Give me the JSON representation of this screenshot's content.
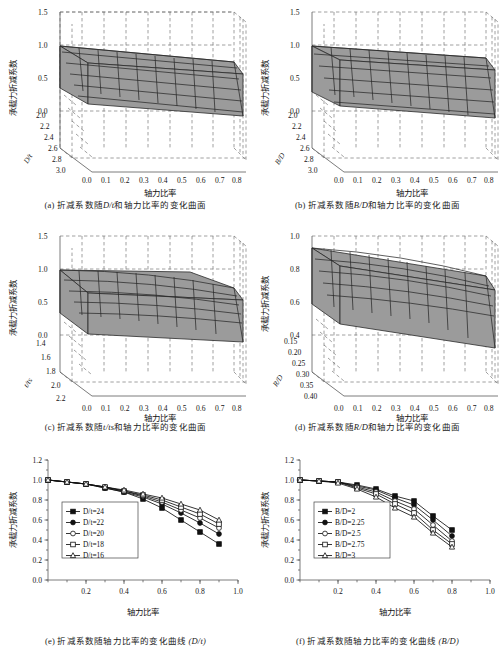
{
  "figure": {
    "surface_fill": "#9b9b9b",
    "mesh_color": "#2a2a2a",
    "axis_color": "#5a5a5a"
  },
  "panels": {
    "a": {
      "caption_prefix": "(a)",
      "caption_text_1": "折减系数随",
      "caption_sym": "D/t",
      "caption_text_2": "和轴力比率的变化曲面",
      "zlabel": "承载力折减系数",
      "xlabel": "轴力比率",
      "ylabel": "D/t",
      "zticks": [
        "1.5",
        "1.0",
        "0.5",
        "0.0"
      ],
      "yticks": [
        "2.0",
        "2.2",
        "2.4",
        "2.6",
        "2.8",
        "3.0"
      ],
      "xticks": [
        "0.0",
        "0.1",
        "0.2",
        "0.3",
        "0.4",
        "0.5",
        "0.6",
        "0.7",
        "0.8"
      ]
    },
    "b": {
      "caption_prefix": "(b)",
      "caption_text_1": "折减系数随",
      "caption_sym": "B/D",
      "caption_text_2": "和轴力比率的变化曲面",
      "zlabel": "承载力折减系数",
      "xlabel": "轴力比率",
      "ylabel": "B/D",
      "zticks": [
        "1.5",
        "1.0",
        "0.5",
        "0.0"
      ],
      "yticks": [
        "2.0",
        "2.2",
        "2.4",
        "2.6",
        "2.8",
        "3.0"
      ],
      "xticks": [
        "0.0",
        "0.1",
        "0.2",
        "0.3",
        "0.4",
        "0.5",
        "0.6",
        "0.7",
        "0.8"
      ]
    },
    "c": {
      "caption_prefix": "(c)",
      "caption_text_1": "折减系数随",
      "caption_sym": "t/ts",
      "caption_text_2": "和轴力比率的变化曲面",
      "zlabel": "承载力折减系数",
      "xlabel": "轴力比率",
      "ylabel": "t/ts",
      "zticks": [
        "1.5",
        "1.0",
        "0.5",
        "0.0"
      ],
      "yticks": [
        "1.4",
        "1.6",
        "1.8",
        "2.0",
        "2.2"
      ],
      "xticks": [
        "0.0",
        "0.1",
        "0.2",
        "0.3",
        "0.4",
        "0.5",
        "0.6",
        "0.7",
        "0.8"
      ]
    },
    "d": {
      "caption_prefix": "(d)",
      "caption_text_1": "折减系数随",
      "caption_sym": "R/D",
      "caption_text_2": "和轴力比率的变化曲面",
      "zlabel": "承载力折减系数",
      "xlabel": "轴力比率",
      "ylabel": "R/D",
      "zticks": [
        "1.0",
        "0.8",
        "0.6",
        "0.4"
      ],
      "yticks": [
        "0.15",
        "0.20",
        "0.25",
        "0.30",
        "0.35",
        "0.40"
      ],
      "xticks": [
        "0.0",
        "0.1",
        "0.2",
        "0.3",
        "0.4",
        "0.5",
        "0.6",
        "0.7",
        "0.8"
      ]
    },
    "e": {
      "caption_prefix": "(e)",
      "caption_text_1": "折减系数随轴力比率的变化曲线",
      "caption_sym": "(D/t)",
      "ylabel": "承载力折减系数",
      "xlabel": "轴力比率"
    },
    "f": {
      "caption_prefix": "(f)",
      "caption_text_1": "折减系数随轴力比率的变化曲线",
      "caption_sym": "(B/D)",
      "ylabel": "承载力折减系数",
      "xlabel": "轴力比率"
    }
  },
  "chart_data": [
    {
      "id": "a",
      "type": "surface",
      "title": "折减系数随D/t和轴力比率的变化曲面",
      "xlabel": "轴力比率",
      "ylabel": "D/t",
      "zlabel": "承载力折减系数",
      "xlim": [
        0.0,
        0.8
      ],
      "ylim": [
        2.0,
        3.0
      ],
      "zlim": [
        0.0,
        1.5
      ],
      "x": [
        0.0,
        0.1,
        0.2,
        0.3,
        0.4,
        0.5,
        0.6,
        0.7,
        0.8
      ],
      "y": [
        2.0,
        2.2,
        2.4,
        2.6,
        2.8,
        3.0
      ],
      "z": [
        [
          1.0,
          0.97,
          0.94,
          0.9,
          0.86,
          0.8,
          0.73,
          0.64,
          0.53
        ],
        [
          1.0,
          0.97,
          0.94,
          0.9,
          0.85,
          0.79,
          0.71,
          0.61,
          0.5
        ],
        [
          1.0,
          0.97,
          0.93,
          0.89,
          0.84,
          0.77,
          0.69,
          0.58,
          0.46
        ],
        [
          1.0,
          0.96,
          0.93,
          0.88,
          0.83,
          0.76,
          0.67,
          0.56,
          0.43
        ],
        [
          1.0,
          0.96,
          0.92,
          0.87,
          0.81,
          0.74,
          0.65,
          0.53,
          0.4
        ],
        [
          1.0,
          0.96,
          0.92,
          0.86,
          0.8,
          0.72,
          0.62,
          0.5,
          0.37
        ]
      ]
    },
    {
      "id": "b",
      "type": "surface",
      "title": "折减系数随B/D和轴力比率的变化曲面",
      "xlabel": "轴力比率",
      "ylabel": "B/D",
      "zlabel": "承载力折减系数",
      "xlim": [
        0.0,
        0.8
      ],
      "ylim": [
        2.0,
        3.0
      ],
      "zlim": [
        0.0,
        1.5
      ],
      "x": [
        0.0,
        0.1,
        0.2,
        0.3,
        0.4,
        0.5,
        0.6,
        0.7,
        0.8
      ],
      "y": [
        2.0,
        2.2,
        2.4,
        2.6,
        2.8,
        3.0
      ],
      "z": [
        [
          1.0,
          0.98,
          0.96,
          0.92,
          0.88,
          0.83,
          0.76,
          0.66,
          0.54
        ],
        [
          1.0,
          0.98,
          0.95,
          0.91,
          0.87,
          0.81,
          0.73,
          0.63,
          0.5
        ],
        [
          1.0,
          0.97,
          0.94,
          0.9,
          0.85,
          0.79,
          0.71,
          0.6,
          0.47
        ],
        [
          1.0,
          0.97,
          0.94,
          0.89,
          0.84,
          0.77,
          0.68,
          0.57,
          0.44
        ],
        [
          1.0,
          0.97,
          0.93,
          0.88,
          0.82,
          0.75,
          0.66,
          0.54,
          0.41
        ],
        [
          1.0,
          0.96,
          0.92,
          0.87,
          0.81,
          0.73,
          0.63,
          0.51,
          0.38
        ]
      ]
    },
    {
      "id": "c",
      "type": "surface",
      "title": "折减系数随t/ts和轴力比率的变化曲面",
      "xlabel": "轴力比率",
      "ylabel": "t/ts",
      "zlabel": "承载力折减系数",
      "xlim": [
        0.0,
        0.8
      ],
      "ylim": [
        1.4,
        2.2
      ],
      "zlim": [
        0.0,
        1.5
      ],
      "x": [
        0.0,
        0.1,
        0.2,
        0.3,
        0.4,
        0.5,
        0.6,
        0.7,
        0.8
      ],
      "y": [
        1.4,
        1.6,
        1.8,
        2.0,
        2.2
      ],
      "z": [
        [
          1.0,
          0.99,
          0.97,
          0.95,
          0.91,
          0.86,
          0.79,
          0.7,
          0.58
        ],
        [
          1.0,
          0.99,
          0.97,
          0.94,
          0.9,
          0.85,
          0.77,
          0.67,
          0.55
        ],
        [
          1.0,
          0.98,
          0.96,
          0.93,
          0.89,
          0.83,
          0.75,
          0.64,
          0.52
        ],
        [
          1.0,
          0.98,
          0.96,
          0.92,
          0.88,
          0.81,
          0.73,
          0.62,
          0.49
        ],
        [
          1.0,
          0.98,
          0.95,
          0.91,
          0.86,
          0.8,
          0.71,
          0.59,
          0.46
        ]
      ]
    },
    {
      "id": "d",
      "type": "surface",
      "title": "折减系数随R/D和轴力比率的变化曲面",
      "xlabel": "轴力比率",
      "ylabel": "R/D",
      "zlabel": "承载力折减系数",
      "xlim": [
        0.0,
        0.8
      ],
      "ylim": [
        0.15,
        0.4
      ],
      "zlim": [
        0.4,
        1.0
      ],
      "x": [
        0.0,
        0.1,
        0.2,
        0.3,
        0.4,
        0.5,
        0.6,
        0.7,
        0.8
      ],
      "y": [
        0.15,
        0.2,
        0.25,
        0.3,
        0.35,
        0.4
      ],
      "z": [
        [
          1.0,
          0.98,
          0.95,
          0.92,
          0.88,
          0.82,
          0.75,
          0.66,
          0.55
        ],
        [
          1.0,
          0.97,
          0.94,
          0.91,
          0.86,
          0.8,
          0.72,
          0.63,
          0.52
        ],
        [
          1.0,
          0.97,
          0.94,
          0.9,
          0.85,
          0.78,
          0.7,
          0.6,
          0.49
        ],
        [
          1.0,
          0.96,
          0.93,
          0.89,
          0.83,
          0.76,
          0.68,
          0.57,
          0.46
        ],
        [
          1.0,
          0.96,
          0.92,
          0.88,
          0.82,
          0.75,
          0.66,
          0.55,
          0.43
        ],
        [
          1.0,
          0.96,
          0.92,
          0.87,
          0.81,
          0.73,
          0.64,
          0.52,
          0.41
        ]
      ]
    },
    {
      "id": "e",
      "type": "line",
      "title": "折减系数随轴力比率的变化曲线 (D/t)",
      "xlabel": "轴力比率",
      "ylabel": "承载力折减系数",
      "xlim": [
        0.0,
        1.0
      ],
      "ylim": [
        0.0,
        1.2
      ],
      "xticks": [
        "0.2",
        "0.4",
        "0.6",
        "0.8",
        "1.0"
      ],
      "yticks": [
        "0.0",
        "0.2",
        "0.4",
        "0.6",
        "0.8",
        "1.0",
        "1.2"
      ],
      "x": [
        0.0,
        0.1,
        0.2,
        0.3,
        0.4,
        0.5,
        0.6,
        0.7,
        0.8,
        0.9
      ],
      "legend_position": "center-left",
      "series": [
        {
          "name": "D/t=24",
          "marker": "filled-square",
          "values": [
            1.0,
            0.98,
            0.96,
            0.92,
            0.88,
            0.81,
            0.72,
            0.6,
            0.48,
            0.36
          ]
        },
        {
          "name": "D/t=22",
          "marker": "filled-circle",
          "values": [
            1.0,
            0.98,
            0.96,
            0.92,
            0.88,
            0.83,
            0.76,
            0.67,
            0.57,
            0.46
          ]
        },
        {
          "name": "D/t=20",
          "marker": "open-circle",
          "values": [
            1.0,
            0.98,
            0.96,
            0.93,
            0.89,
            0.84,
            0.78,
            0.7,
            0.62,
            0.52
          ]
        },
        {
          "name": "D/t=18",
          "marker": "open-square",
          "values": [
            1.0,
            0.98,
            0.96,
            0.93,
            0.89,
            0.85,
            0.8,
            0.73,
            0.66,
            0.56
          ]
        },
        {
          "name": "D/t=16",
          "marker": "open-triangle",
          "values": [
            1.0,
            0.98,
            0.96,
            0.93,
            0.9,
            0.86,
            0.82,
            0.76,
            0.7,
            0.6
          ]
        }
      ]
    },
    {
      "id": "f",
      "type": "line",
      "title": "折减系数随轴力比率的变化曲线 (B/D)",
      "xlabel": "轴力比率",
      "ylabel": "承载力折减系数",
      "xlim": [
        0.0,
        1.0
      ],
      "ylim": [
        0.0,
        1.2
      ],
      "xticks": [
        "0.2",
        "0.4",
        "0.6",
        "0.8",
        "1.0"
      ],
      "yticks": [
        "0.0",
        "0.2",
        "0.4",
        "0.6",
        "0.8",
        "1.0",
        "1.2"
      ],
      "x": [
        0.0,
        0.1,
        0.2,
        0.3,
        0.4,
        0.5,
        0.6,
        0.7,
        0.8
      ],
      "legend_position": "center-left",
      "series": [
        {
          "name": "B/D=2",
          "marker": "filled-square",
          "values": [
            1.0,
            0.99,
            0.98,
            0.95,
            0.91,
            0.84,
            0.79,
            0.64,
            0.5
          ]
        },
        {
          "name": "B/D=2.25",
          "marker": "filled-circle",
          "values": [
            1.0,
            0.99,
            0.98,
            0.94,
            0.9,
            0.82,
            0.75,
            0.6,
            0.44
          ]
        },
        {
          "name": "B/D=2.5",
          "marker": "open-circle",
          "values": [
            1.0,
            0.99,
            0.98,
            0.93,
            0.88,
            0.79,
            0.71,
            0.55,
            0.39
          ]
        },
        {
          "name": "B/D=2.75",
          "marker": "open-square",
          "values": [
            1.0,
            0.99,
            0.98,
            0.92,
            0.86,
            0.76,
            0.67,
            0.5,
            0.36
          ]
        },
        {
          "name": "B/D=3",
          "marker": "open-triangle",
          "values": [
            1.0,
            0.99,
            0.97,
            0.91,
            0.83,
            0.72,
            0.63,
            0.47,
            0.33
          ]
        }
      ]
    }
  ]
}
